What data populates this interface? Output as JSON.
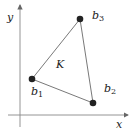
{
  "diagram": {
    "axes": {
      "x_label": "x",
      "y_label": "y"
    },
    "region_label": "K",
    "vertices": [
      {
        "name": "b1",
        "base": "b",
        "sub": "1"
      },
      {
        "name": "b2",
        "base": "b",
        "sub": "2"
      },
      {
        "name": "b3",
        "base": "b",
        "sub": "3"
      }
    ],
    "colors": {
      "axis": "#888888",
      "edge": "#555555",
      "vertex": "#222222"
    }
  }
}
